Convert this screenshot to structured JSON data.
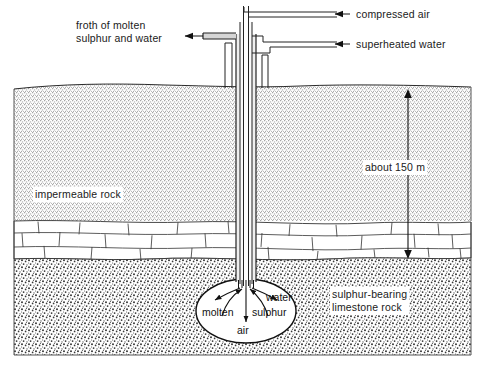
{
  "diagram": {
    "labels": {
      "froth": "froth of molten\nsulphur and water",
      "compressed_air": "compressed air",
      "superheated_water": "superheated water",
      "impermeable_rock": "impermeable rock",
      "depth": "about 150 m",
      "sulphur_bearing": "sulphur-bearing\nlimestone rock"
    },
    "chamber": {
      "molten": "molten",
      "sulphur": "sulphur",
      "water": "water",
      "air": "air"
    },
    "colors": {
      "line": "#1a1a1a",
      "sand_fill": "#d9d9d9",
      "gravel_fill": "#ffffff",
      "pipe_fill": "#e8e8e8",
      "background": "#ffffff"
    },
    "annotations": {
      "depth_value": "150",
      "depth_unit": "m",
      "depth_qualifier": "about"
    }
  }
}
